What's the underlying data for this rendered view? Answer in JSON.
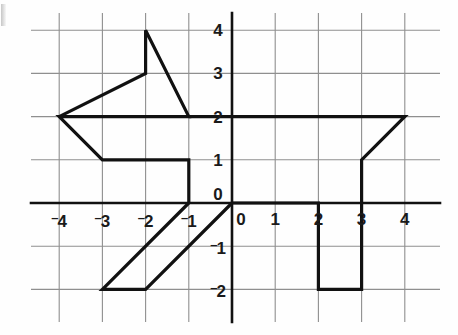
{
  "figure": {
    "title": "",
    "corner_mark": "6",
    "background": "#fefefe",
    "grid_color": "#8a8a8a",
    "axis_color": "#111111",
    "shape_color": "#111111"
  },
  "chart_data": {
    "type": "line",
    "title": "",
    "xlabel": "",
    "ylabel": "",
    "xlim": [
      -4.7,
      4.7
    ],
    "ylim": [
      -2.7,
      4.6
    ],
    "grid": true,
    "legend": null,
    "xticks": [
      -4,
      -3,
      -2,
      -1,
      0,
      1,
      2,
      3,
      4
    ],
    "yticks": [
      -2,
      -1,
      0,
      1,
      2,
      3,
      4
    ],
    "xtick_labels": [
      "-4",
      "-3",
      "-2",
      "-1",
      "0",
      "1",
      "2",
      "3",
      "4"
    ],
    "ytick_labels": [
      "-2",
      "-1",
      "0",
      "1",
      "2",
      "3",
      "4"
    ],
    "annotations": [],
    "series": [
      {
        "name": "dog-outline-head",
        "closed": false,
        "points": [
          [
            -4,
            2
          ],
          [
            -2,
            3
          ],
          [
            -2,
            4
          ],
          [
            -1,
            2
          ],
          [
            -4,
            2
          ],
          [
            -3,
            1
          ],
          [
            -1,
            1
          ],
          [
            -1,
            0
          ]
        ]
      },
      {
        "name": "dog-outline-front-legs",
        "closed": false,
        "points": [
          [
            -1,
            0
          ],
          [
            -3,
            -2
          ],
          [
            -2,
            -2
          ],
          [
            0,
            0
          ]
        ]
      },
      {
        "name": "dog-outline-body-tail-back-legs",
        "closed": false,
        "points": [
          [
            0,
            0
          ],
          [
            2,
            0
          ],
          [
            2,
            -2
          ],
          [
            3,
            -2
          ],
          [
            3,
            1
          ],
          [
            4,
            2
          ],
          [
            -1,
            2
          ]
        ]
      }
    ]
  },
  "axes": {
    "x_axis_label_zero": "0",
    "y_axis_label_zero": "0"
  }
}
